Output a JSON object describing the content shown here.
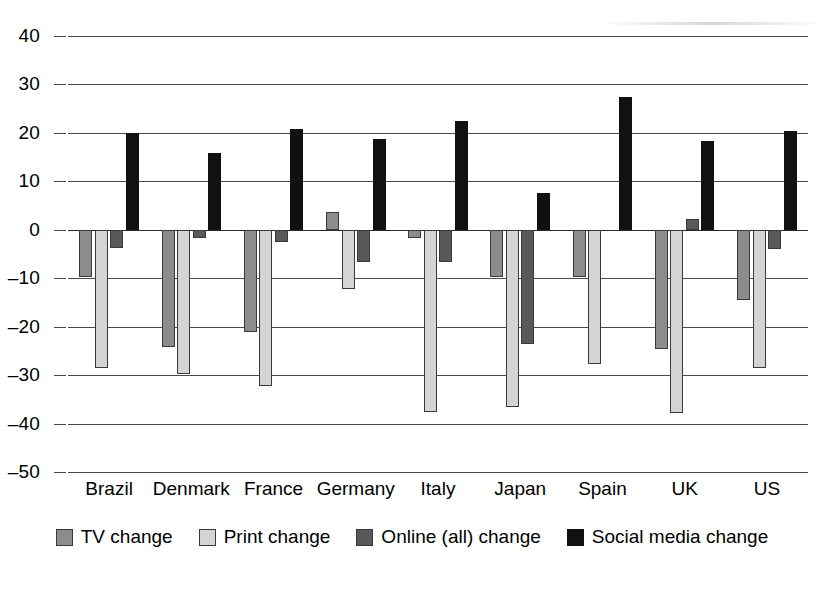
{
  "chart_data": {
    "type": "bar",
    "title": "",
    "subtitle": "",
    "xlabel": "",
    "ylabel": "",
    "ylim": [
      -50,
      40
    ],
    "ytick_step": 10,
    "yticks": [
      40,
      30,
      20,
      10,
      0,
      -10,
      -20,
      -30,
      -40,
      -50
    ],
    "ytick_labels": [
      "40",
      "30",
      "20",
      "10",
      "0",
      "–10",
      "–20",
      "–30",
      "–40",
      "–50"
    ],
    "grid": true,
    "legend_position": "bottom",
    "categories": [
      "Brazil",
      "Denmark",
      "France",
      "Germany",
      "Italy",
      "Japan",
      "Spain",
      "UK",
      "US"
    ],
    "series": [
      {
        "name": "TV change",
        "color": "#8c8c8c",
        "values": [
          -9.8,
          -24.3,
          -21.2,
          3.7,
          -1.6,
          -9.7,
          -9.8,
          -24.6,
          -14.6
        ]
      },
      {
        "name": "Print change",
        "color": "#d4d4d4",
        "values": [
          -28.5,
          -29.8,
          -32.2,
          -12.2,
          -37.6,
          -36.6,
          -27.7,
          -37.8,
          -28.5
        ]
      },
      {
        "name": "Online (all) change",
        "color": "#595959",
        "values": [
          -3.7,
          -1.8,
          -2.6,
          -6.6,
          -6.6,
          -23.6,
          0.0,
          2.3,
          -3.9
        ]
      },
      {
        "name": "Social media change",
        "color": "#111111",
        "values": [
          20.0,
          15.9,
          20.8,
          18.7,
          22.5,
          7.5,
          27.5,
          18.3,
          20.3
        ]
      }
    ]
  },
  "legend": {
    "items": [
      {
        "label": "TV change",
        "key": "tv"
      },
      {
        "label": "Print change",
        "key": "print"
      },
      {
        "label": "Online (all) change",
        "key": "online"
      },
      {
        "label": "Social media change",
        "key": "social"
      }
    ]
  }
}
